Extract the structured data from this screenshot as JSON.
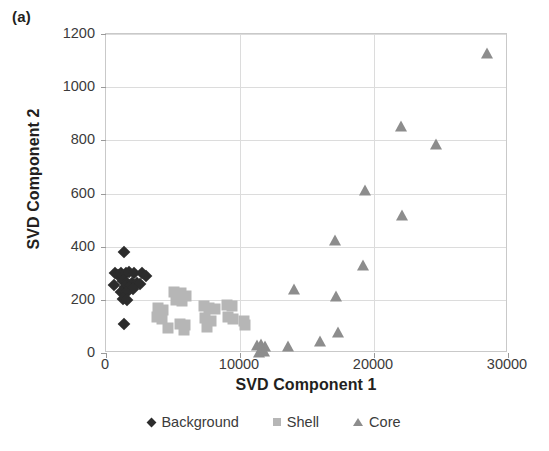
{
  "figure": {
    "panel_label": "(a)",
    "background_color": "#ffffff"
  },
  "chart_data": {
    "type": "scatter",
    "title": "",
    "xlabel": "SVD Component 1",
    "ylabel": "SVD Component 2",
    "xlim": [
      0,
      30000
    ],
    "ylim": [
      0,
      1200
    ],
    "xticks": [
      "0",
      "10000",
      "20000",
      "30000"
    ],
    "xtick_values": [
      0,
      10000,
      20000,
      30000
    ],
    "yticks": [
      "0",
      "200",
      "400",
      "600",
      "800",
      "1000",
      "1200"
    ],
    "ytick_values": [
      0,
      200,
      400,
      600,
      800,
      1000,
      1200
    ],
    "grid": true,
    "legend_position": "bottom-center",
    "series": [
      {
        "name": "Background",
        "marker": "diamond",
        "color": "#2c2c2c",
        "points": [
          [
            1350,
            380
          ],
          [
            700,
            300
          ],
          [
            900,
            295
          ],
          [
            1150,
            300
          ],
          [
            1500,
            300
          ],
          [
            1750,
            305
          ],
          [
            2100,
            300
          ],
          [
            2700,
            300
          ],
          [
            3000,
            290
          ],
          [
            1250,
            270
          ],
          [
            1600,
            265
          ],
          [
            1950,
            262
          ],
          [
            2300,
            265
          ],
          [
            2550,
            260
          ],
          [
            600,
            255
          ],
          [
            1400,
            250
          ],
          [
            1700,
            245
          ],
          [
            2000,
            240
          ],
          [
            1150,
            230
          ],
          [
            1500,
            225
          ],
          [
            1300,
            205
          ],
          [
            1550,
            200
          ],
          [
            1350,
            110
          ]
        ]
      },
      {
        "name": "Shell",
        "marker": "square",
        "color": "#b6b6b6",
        "points": [
          [
            5100,
            230
          ],
          [
            5600,
            225
          ],
          [
            6000,
            215
          ],
          [
            5200,
            200
          ],
          [
            5700,
            195
          ],
          [
            3900,
            170
          ],
          [
            4250,
            160
          ],
          [
            7300,
            175
          ],
          [
            7700,
            170
          ],
          [
            8100,
            165
          ],
          [
            9000,
            180
          ],
          [
            9400,
            175
          ],
          [
            3800,
            135
          ],
          [
            4150,
            128
          ],
          [
            5500,
            110
          ],
          [
            5900,
            105
          ],
          [
            7400,
            130
          ],
          [
            7800,
            120
          ],
          [
            9100,
            135
          ],
          [
            9500,
            128
          ],
          [
            4600,
            95
          ],
          [
            5800,
            85
          ],
          [
            7500,
            98
          ],
          [
            10300,
            120
          ],
          [
            10400,
            105
          ]
        ]
      },
      {
        "name": "Core",
        "marker": "triangle",
        "color": "#8d8d8d",
        "points": [
          [
            11300,
            30
          ],
          [
            11600,
            35
          ],
          [
            11900,
            28
          ],
          [
            11400,
            5
          ],
          [
            11800,
            8
          ],
          [
            13600,
            25
          ],
          [
            16000,
            45
          ],
          [
            14000,
            240
          ],
          [
            17200,
            215
          ],
          [
            17300,
            80
          ],
          [
            17100,
            425
          ],
          [
            19300,
            615
          ],
          [
            19200,
            330
          ],
          [
            22000,
            855
          ],
          [
            22100,
            520
          ],
          [
            24600,
            785
          ],
          [
            28400,
            1130
          ]
        ]
      }
    ]
  },
  "legend": {
    "items": [
      {
        "label": "Background",
        "marker": "diamond-icon",
        "color": "#2c2c2c"
      },
      {
        "label": "Shell",
        "marker": "square-icon",
        "color": "#b6b6b6"
      },
      {
        "label": "Core",
        "marker": "triangle-icon",
        "color": "#8d8d8d"
      }
    ]
  }
}
